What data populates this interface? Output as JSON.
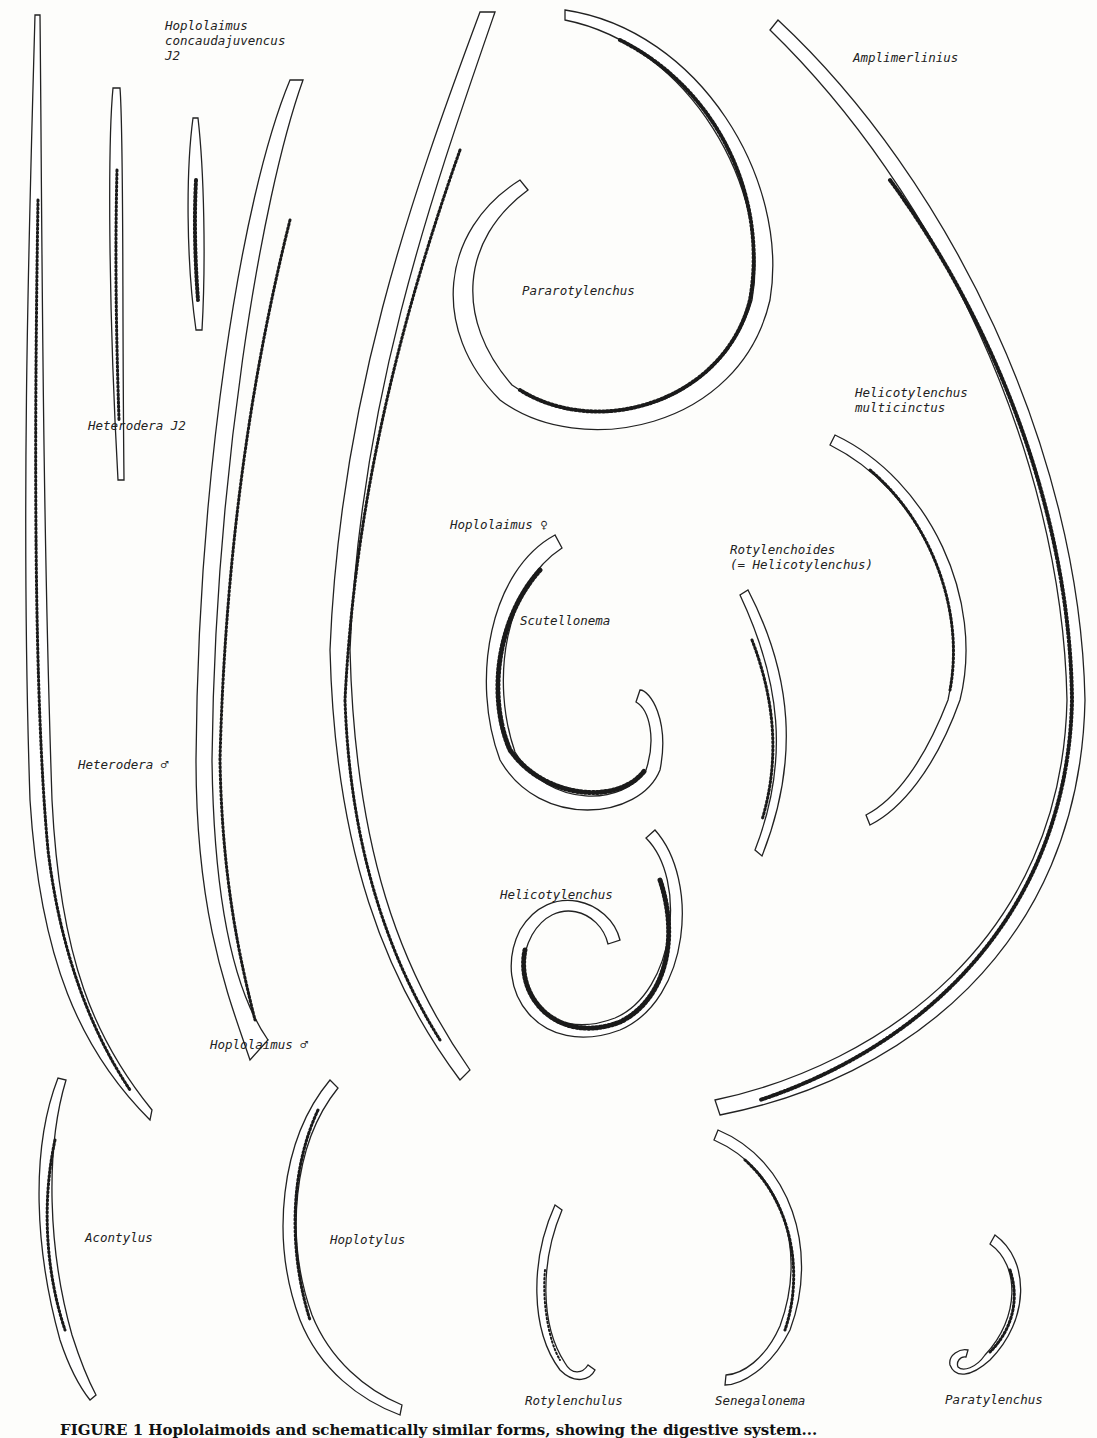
{
  "figure": {
    "caption": "FIGURE 1   Hoplolaimoids and schematically similar forms, showing the digestive system...",
    "labels": [
      {
        "id": "hoplolaimus-concaudajuvencus-j2",
        "text": "Hoplolaimus\nconcaudajuvencus\nJ2",
        "x": 165,
        "y": 18
      },
      {
        "id": "heterodera-j2",
        "text": "Heterodera J2",
        "x": 88,
        "y": 418
      },
      {
        "id": "heterodera-male",
        "text": "Heterodera ♂",
        "x": 78,
        "y": 757
      },
      {
        "id": "hoplolaimus-male",
        "text": "Hoplolaimus ♂",
        "x": 210,
        "y": 1037
      },
      {
        "id": "hoplolaimus-female",
        "text": "Hoplolaimus ♀",
        "x": 450,
        "y": 517
      },
      {
        "id": "pararotylenchus",
        "text": "Pararotylenchus",
        "x": 522,
        "y": 283
      },
      {
        "id": "amplimerlinius",
        "text": "Amplimerlinius",
        "x": 853,
        "y": 50
      },
      {
        "id": "helicotylenchus-multicinctus",
        "text": "Helicotylenchus\nmulticinctus",
        "x": 855,
        "y": 385
      },
      {
        "id": "rotylenchoides",
        "text": "Rotylenchoides\n(= Helicotylenchus)",
        "x": 730,
        "y": 542
      },
      {
        "id": "scutellonema",
        "text": "Scutellonema",
        "x": 520,
        "y": 613
      },
      {
        "id": "helicotylenchus",
        "text": "Helicotylenchus",
        "x": 500,
        "y": 887
      },
      {
        "id": "acontylus",
        "text": "Acontylus",
        "x": 85,
        "y": 1230
      },
      {
        "id": "hoplotylus",
        "text": "Hoplotylus",
        "x": 330,
        "y": 1232
      },
      {
        "id": "rotylenchulus",
        "text": "Rotylenchulus",
        "x": 525,
        "y": 1393
      },
      {
        "id": "senegalonema",
        "text": "Senegalonema",
        "x": 715,
        "y": 1393
      },
      {
        "id": "paratylenchus",
        "text": "Paratylenchus",
        "x": 945,
        "y": 1392
      }
    ]
  }
}
